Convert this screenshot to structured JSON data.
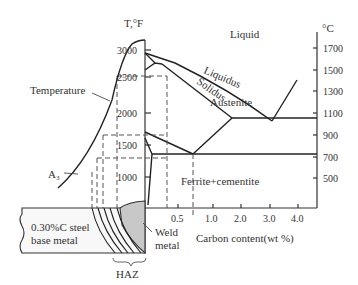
{
  "axes": {
    "left_unit": "T,°F",
    "right_unit": "°C",
    "left_ticks": [
      "3000",
      "2500",
      "2000",
      "1500",
      "1000"
    ],
    "right_ticks": [
      "1700",
      "1500",
      "1300",
      "1100",
      "900",
      "700",
      "500"
    ],
    "x_ticks": [
      "0.5",
      "1.0",
      "2.0",
      "3.0",
      "4.0"
    ],
    "x_label": "Carbon content(wt %)"
  },
  "regions": {
    "liquid": "Liquid",
    "austenite": "Austenite",
    "ferrite_cementite": "Ferrite+cementite"
  },
  "curves": {
    "liquidus": "Liquidus",
    "solidus": "Solidus",
    "temperature": "Temperature",
    "a3": "A₃"
  },
  "weld": {
    "base_metal_line1": "0.30%C steel",
    "base_metal_line2": "base metal",
    "weld_metal_line1": "Weld",
    "weld_metal_line2": "metal",
    "haz": "HAZ"
  }
}
